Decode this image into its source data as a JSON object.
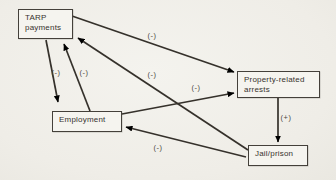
{
  "figure": {
    "type": "causal-loop-diagram",
    "background_color": "#f1efe9",
    "ink_color": "#35312b",
    "nodes": [
      {
        "id": "tarp",
        "label_lines": [
          "TARP",
          "payments"
        ],
        "x": 18,
        "y": 9,
        "w": 55,
        "h": 30
      },
      {
        "id": "property",
        "label_lines": [
          "Property-related",
          "arrests"
        ],
        "x": 237,
        "y": 71,
        "w": 83,
        "h": 27
      },
      {
        "id": "employment",
        "label_lines": [
          "Employment"
        ],
        "x": 52,
        "y": 111,
        "w": 70,
        "h": 21
      },
      {
        "id": "jail",
        "label_lines": [
          "Jail/prison"
        ],
        "x": 248,
        "y": 145,
        "w": 60,
        "h": 21
      }
    ],
    "edges": [
      {
        "from": "tarp",
        "to": "property",
        "sign": "(-)",
        "x1": 72,
        "y1": 16,
        "x2": 234,
        "y2": 72,
        "label_x": 152,
        "label_y": 38
      },
      {
        "from": "tarp",
        "to": "employment",
        "sign": "(-)",
        "x1": 46,
        "y1": 40,
        "x2": 58,
        "y2": 102,
        "label_x": 56,
        "label_y": 75
      },
      {
        "from": "employment",
        "to": "tarp",
        "sign": "(-)",
        "x1": 90,
        "y1": 111,
        "x2": 64,
        "y2": 44,
        "label_x": 84,
        "label_y": 75
      },
      {
        "from": "employment",
        "to": "property",
        "sign": "(-)",
        "x1": 122,
        "y1": 114,
        "x2": 234,
        "y2": 93,
        "label_x": 196,
        "label_y": 90
      },
      {
        "from": "jail",
        "to": "tarp",
        "sign": "(-)",
        "x1": 248,
        "y1": 150,
        "x2": 78,
        "y2": 38,
        "label_x": 152,
        "label_y": 77
      },
      {
        "from": "jail",
        "to": "employment",
        "sign": "(-)",
        "x1": 246,
        "y1": 157,
        "x2": 126,
        "y2": 127,
        "label_x": 158,
        "label_y": 150
      },
      {
        "from": "property",
        "to": "jail",
        "sign": "(+)",
        "x1": 278,
        "y1": 98,
        "x2": 278,
        "y2": 142,
        "label_x": 286,
        "label_y": 120
      }
    ]
  }
}
